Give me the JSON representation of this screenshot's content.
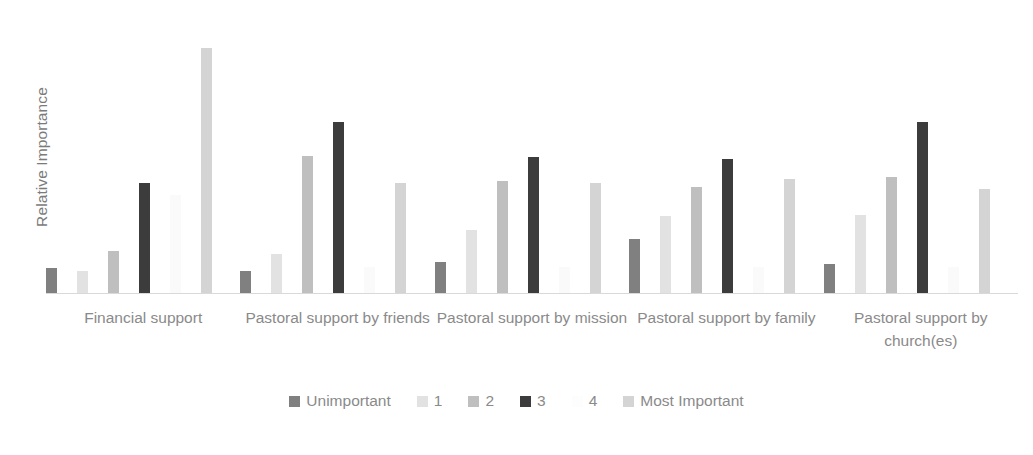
{
  "chart_data": {
    "type": "bar",
    "title": "",
    "subtitle": "",
    "xlabel": "",
    "ylabel": "Relative Importance",
    "grid": false,
    "legend_position": "bottom",
    "axis_ranges": {
      "y": [
        0,
        1
      ]
    },
    "y_tick_labels": [],
    "categories": [
      "Financial support",
      "Pastoral support by friends",
      "Pastoral support by mission",
      "Pastoral support by family",
      "Pastoral support by church(es)"
    ],
    "series": [
      {
        "name": "Unimportant",
        "color": "#808080",
        "values": [
          0.091,
          0.08,
          0.113,
          0.196,
          0.105
        ]
      },
      {
        "name": "1",
        "color": "#e2e2e2",
        "values": [
          0.08,
          0.142,
          0.229,
          0.28,
          0.284
        ]
      },
      {
        "name": "2",
        "color": "#bfbfbf",
        "values": [
          0.153,
          0.498,
          0.407,
          0.385,
          0.422
        ]
      },
      {
        "name": "3",
        "color": "#3c3c3c",
        "values": [
          0.4,
          0.622,
          0.495,
          0.487,
          0.622
        ]
      },
      {
        "name": "4",
        "color": "#fafafa",
        "values": [
          0.356,
          0.095,
          0.095,
          0.095,
          0.095
        ]
      },
      {
        "name": "Most Important",
        "color": "#d4d4d4",
        "values": [
          0.891,
          0.4,
          0.4,
          0.415,
          0.378
        ]
      }
    ]
  },
  "legend": {
    "items": [
      {
        "label": "Unimportant",
        "color": "#808080"
      },
      {
        "label": "1",
        "color": "#e2e2e2"
      },
      {
        "label": "2",
        "color": "#bfbfbf"
      },
      {
        "label": "3",
        "color": "#3c3c3c"
      },
      {
        "label": "4",
        "color": "#fdfdfd"
      },
      {
        "label": "Most Important",
        "color": "#d4d4d4"
      }
    ]
  }
}
